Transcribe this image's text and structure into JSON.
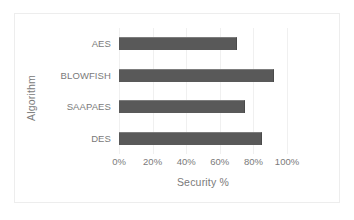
{
  "chart_data": {
    "type": "bar",
    "orientation": "horizontal",
    "title": "",
    "xlabel": "Security %",
    "ylabel": "Algorithm",
    "categories": [
      "AES",
      "BLOWFISH",
      "SAAPAES",
      "DES"
    ],
    "values": [
      70,
      92,
      75,
      85
    ],
    "series": [
      {
        "name": "Security %",
        "values": [
          70,
          92,
          75,
          85
        ]
      }
    ],
    "xlim": [
      0,
      100
    ],
    "xticks": [
      0,
      20,
      40,
      60,
      80,
      100
    ],
    "xtick_labels": [
      "0%",
      "20%",
      "40%",
      "60%",
      "80%",
      "100%"
    ],
    "grid": "vertical",
    "legend": "none",
    "bar_color": "#595959",
    "gridline_color": "#f0f0f0",
    "text_color": "#7a7a7a",
    "background_color": "#ffffff"
  }
}
